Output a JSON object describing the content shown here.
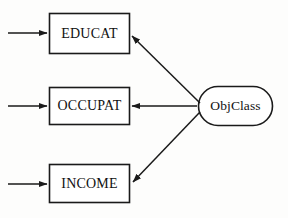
{
  "diagram": {
    "type": "path-diagram",
    "title": "",
    "background_color": "#fdfdfc",
    "stroke_color": "#1a1a1a",
    "nodes": [
      {
        "id": "educat",
        "label": "EDUCAT",
        "shape": "rectangle",
        "x": 49,
        "y": 13,
        "width": 81,
        "height": 41
      },
      {
        "id": "occupat",
        "label": "OCCUPAT",
        "shape": "rectangle",
        "x": 49,
        "y": 87,
        "width": 81,
        "height": 38
      },
      {
        "id": "income",
        "label": "INCOME",
        "shape": "rectangle",
        "x": 49,
        "y": 164,
        "width": 81,
        "height": 39
      },
      {
        "id": "objclass",
        "label": "ObjClass",
        "shape": "stadium",
        "x": 198,
        "y": 86,
        "width": 75,
        "height": 40
      }
    ],
    "edges": [
      {
        "id": "error-to-educat",
        "from": "",
        "to": "educat",
        "style": "solid",
        "arrow": "end",
        "points": "8,33 46,33"
      },
      {
        "id": "error-to-occupat",
        "from": "",
        "to": "occupat",
        "style": "solid",
        "arrow": "end",
        "points": "8,106 46,106"
      },
      {
        "id": "error-to-income",
        "from": "",
        "to": "income",
        "style": "solid",
        "arrow": "end",
        "points": "8,184 46,184"
      },
      {
        "id": "objclass-to-educat",
        "from": "objclass",
        "to": "educat",
        "style": "solid",
        "arrow": "end",
        "points": "200,103 133,37"
      },
      {
        "id": "objclass-to-occupat",
        "from": "objclass",
        "to": "occupat",
        "style": "solid",
        "arrow": "end",
        "points": "197,106 134,106"
      },
      {
        "id": "objclass-to-income",
        "from": "objclass",
        "to": "income",
        "style": "solid",
        "arrow": "end",
        "points": "200,112 134,181"
      }
    ]
  }
}
